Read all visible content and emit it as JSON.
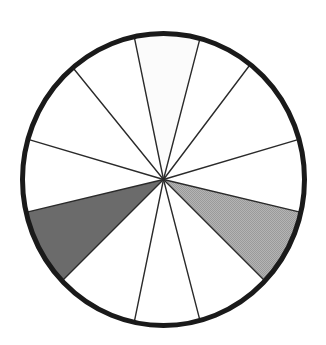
{
  "figure": {
    "type": "pie",
    "background_color": "#ffffff",
    "outline_color": "#1a1a1a",
    "spoke_color": "#2a2a2a",
    "outline_width_px": 5,
    "spoke_width_px": 1.4,
    "center_x": 163.5,
    "center_y": 179.5,
    "radius_x": 141,
    "radius_y": 146
  },
  "chart_data": {
    "type": "pie",
    "subtitle": "",
    "xlabel": "",
    "ylabel": "",
    "grid": false,
    "legend_position": "none",
    "total_sectors": 12,
    "units": "degrees",
    "note": "Circle divided into 12 wedges by 12 radial spokes; 2 wedges are shaded.",
    "colors": {
      "white": "#ffffff",
      "offwhite": "#fbfbfb",
      "light_gray": "#a9a9a9",
      "dark_gray": "#6b6b6b",
      "outline": "#1a1a1a"
    },
    "spoke_angles_deg": [
      -164,
      -130,
      -102,
      -75,
      -52,
      -16,
      13,
      44,
      75,
      102,
      136,
      167
    ],
    "categories": [
      "sector-1",
      "sector-2",
      "sector-3",
      "sector-4",
      "sector-5",
      "sector-6",
      "sector-7",
      "sector-8",
      "sector-9",
      "sector-10",
      "sector-11",
      "sector-12"
    ],
    "values": [
      34,
      28,
      27,
      23,
      36,
      29,
      31,
      31,
      27,
      34,
      31,
      29
    ],
    "sectors": [
      {
        "id": "sector-1",
        "label": "sector-1",
        "start_deg": -164,
        "end_deg": -130,
        "span_deg": 34,
        "fill": "#ffffff",
        "fill_name": "white",
        "shaded": false
      },
      {
        "id": "sector-2",
        "label": "sector-2",
        "start_deg": -130,
        "end_deg": -102,
        "span_deg": 28,
        "fill": "#ffffff",
        "fill_name": "white",
        "shaded": false
      },
      {
        "id": "sector-3",
        "label": "sector-3",
        "start_deg": -102,
        "end_deg": -75,
        "span_deg": 27,
        "fill": "#fbfbfb",
        "fill_name": "offwhite",
        "shaded": false
      },
      {
        "id": "sector-4",
        "label": "sector-4",
        "start_deg": -75,
        "end_deg": -52,
        "span_deg": 23,
        "fill": "#ffffff",
        "fill_name": "white",
        "shaded": false
      },
      {
        "id": "sector-5",
        "label": "sector-5",
        "start_deg": -52,
        "end_deg": -16,
        "span_deg": 36,
        "fill": "#ffffff",
        "fill_name": "white",
        "shaded": false
      },
      {
        "id": "sector-6",
        "label": "sector-6",
        "start_deg": -16,
        "end_deg": 13,
        "span_deg": 29,
        "fill": "#ffffff",
        "fill_name": "white",
        "shaded": false
      },
      {
        "id": "sector-7",
        "label": "sector-7",
        "start_deg": 13,
        "end_deg": 44,
        "span_deg": 31,
        "fill": "#a9a9a9",
        "fill_name": "light_gray",
        "shaded": true
      },
      {
        "id": "sector-8",
        "label": "sector-8",
        "start_deg": 44,
        "end_deg": 75,
        "span_deg": 31,
        "fill": "#ffffff",
        "fill_name": "white",
        "shaded": false
      },
      {
        "id": "sector-9",
        "label": "sector-9",
        "start_deg": 75,
        "end_deg": 102,
        "span_deg": 27,
        "fill": "#ffffff",
        "fill_name": "white",
        "shaded": false
      },
      {
        "id": "sector-10",
        "label": "sector-10",
        "start_deg": 102,
        "end_deg": 136,
        "span_deg": 34,
        "fill": "#ffffff",
        "fill_name": "white",
        "shaded": false
      },
      {
        "id": "sector-11",
        "label": "sector-11",
        "start_deg": 136,
        "end_deg": 167,
        "span_deg": 31,
        "fill": "#6b6b6b",
        "fill_name": "dark_gray",
        "shaded": true
      },
      {
        "id": "sector-12",
        "label": "sector-12",
        "start_deg": 167,
        "end_deg": 196,
        "span_deg": 29,
        "fill": "#ffffff",
        "fill_name": "white",
        "shaded": false
      }
    ]
  }
}
